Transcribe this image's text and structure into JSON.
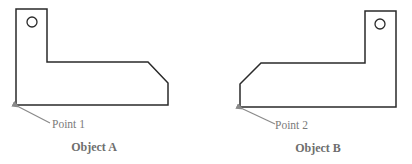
{
  "diagram": {
    "objects": [
      {
        "id": "A",
        "caption": "Object A",
        "point_label": "Point 1",
        "outline_points": "16,9 47,9 47,62 148,62 168,83 168,105 16,105",
        "hole": {
          "cx": 32,
          "cy": 22,
          "r": 5
        },
        "pointer": {
          "x1": 50,
          "y1": 123,
          "x2": 19,
          "y2": 107
        },
        "point_label_pos": {
          "x": 52,
          "y": 128
        },
        "caption_pos": {
          "x": 94,
          "y": 151
        }
      },
      {
        "id": "B",
        "caption": "Object B",
        "point_label": "Point 2",
        "outline_points": "365,11 396,11 396,107 240,107 240,84 261,63 365,63",
        "hole": {
          "cx": 380,
          "cy": 24,
          "r": 5
        },
        "pointer": {
          "x1": 275,
          "y1": 124,
          "x2": 243,
          "y2": 109
        },
        "point_label_pos": {
          "x": 275,
          "y": 129
        },
        "caption_pos": {
          "x": 318,
          "y": 152
        }
      }
    ],
    "colors": {
      "outline": "#2a2a2a",
      "pointer": "#8a8a8a",
      "label": "#7a7a7a",
      "caption": "#6e6e6e",
      "background": "#ffffff"
    }
  }
}
